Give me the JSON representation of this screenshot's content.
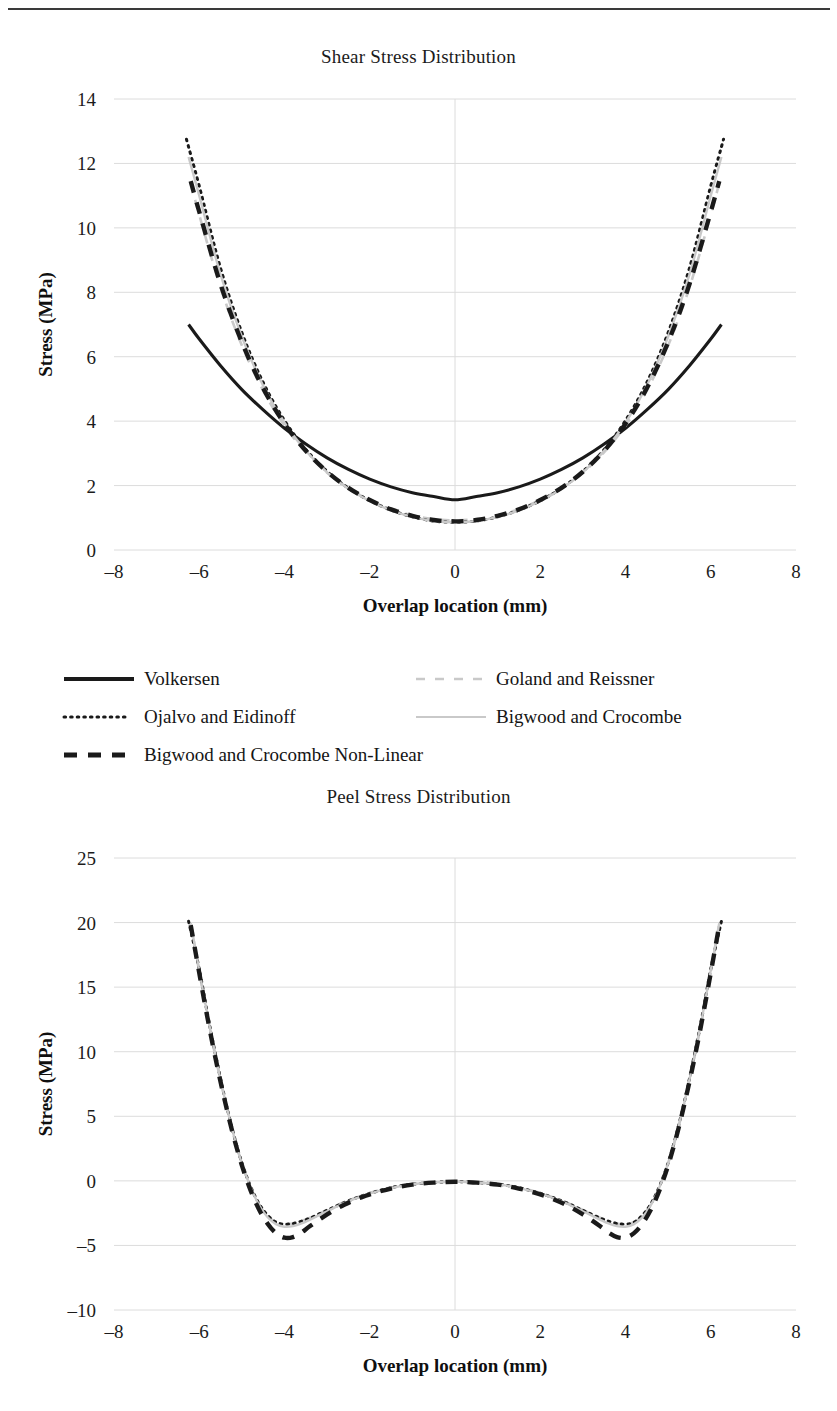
{
  "document": {
    "has_top_rule": true
  },
  "charts": [
    {
      "id": "shear",
      "title": "Shear Stress Distribution",
      "xlabel": "Overlap location (mm)",
      "ylabel": "Stress (MPa)"
    },
    {
      "id": "peel",
      "title": "Peel Stress Distribution",
      "xlabel": "Overlap location (mm)",
      "ylabel": "Stress (MPa)"
    }
  ],
  "legend": {
    "items": [
      {
        "label": "Volkersen",
        "style": "solid-thick-black",
        "color": "#1a1a1a"
      },
      {
        "label": "Goland and Reissner",
        "style": "dashed-thin-gray",
        "color": "#c9c9c9"
      },
      {
        "label": "Ojalvo and Eidinoff",
        "style": "dotted-black",
        "color": "#1a1a1a"
      },
      {
        "label": "Bigwood and Crocombe",
        "style": "solid-thin-gray",
        "color": "#c9c9c9"
      },
      {
        "label": "Bigwood and Crocombe Non-Linear",
        "style": "dashed-thick-black",
        "color": "#1a1a1a"
      }
    ]
  },
  "chart_data": [
    {
      "type": "line",
      "id": "shear",
      "title": "Shear Stress Distribution",
      "xlabel": "Overlap location (mm)",
      "ylabel": "Stress (MPa)",
      "xlim": [
        -8,
        8
      ],
      "ylim": [
        0,
        14
      ],
      "xticks": [
        -8,
        -6,
        -4,
        -2,
        0,
        2,
        4,
        6,
        8
      ],
      "xticklabels": [
        "–8",
        "–6",
        "–4",
        "–2",
        "0",
        "2",
        "4",
        "6",
        "8"
      ],
      "yticks": [
        0,
        2,
        4,
        6,
        8,
        10,
        12,
        14
      ],
      "yticklabels": [
        "0",
        "2",
        "4",
        "6",
        "8",
        "10",
        "12",
        "14"
      ],
      "grid": true,
      "legend_position": "below",
      "series": [
        {
          "name": "Volkersen",
          "style": "solid-thick-black",
          "color": "#1a1a1a",
          "x": [
            -6.25,
            -6.0,
            -5.5,
            -5.0,
            -4.5,
            -4.0,
            -3.5,
            -3.0,
            -2.5,
            -2.0,
            -1.5,
            -1.0,
            -0.5,
            0.0,
            0.5,
            1.0,
            1.5,
            2.0,
            2.5,
            3.0,
            3.5,
            4.0,
            4.5,
            5.0,
            5.5,
            6.0,
            6.25
          ],
          "y": [
            7.0,
            6.55,
            5.72,
            4.98,
            4.35,
            3.78,
            3.29,
            2.86,
            2.5,
            2.2,
            1.96,
            1.78,
            1.66,
            1.56,
            1.66,
            1.78,
            1.96,
            2.2,
            2.5,
            2.86,
            3.29,
            3.78,
            4.35,
            4.98,
            5.72,
            6.55,
            7.0
          ]
        },
        {
          "name": "Goland and Reissner",
          "style": "dashed-thin-gray",
          "color": "#c9c9c9",
          "x": [
            -6.2,
            -6.0,
            -5.5,
            -5.0,
            -4.5,
            -4.0,
            -3.5,
            -3.0,
            -2.5,
            -2.0,
            -1.5,
            -1.0,
            -0.5,
            0.0,
            0.5,
            1.0,
            1.5,
            2.0,
            2.5,
            3.0,
            3.5,
            4.0,
            4.5,
            5.0,
            5.5,
            6.0,
            6.2
          ],
          "y": [
            11.4,
            10.4,
            8.15,
            6.35,
            4.95,
            3.86,
            3.04,
            2.4,
            1.92,
            1.55,
            1.27,
            1.08,
            0.96,
            0.92,
            0.96,
            1.08,
            1.27,
            1.55,
            1.92,
            2.4,
            3.04,
            3.86,
            4.95,
            6.35,
            8.15,
            10.4,
            11.4
          ]
        },
        {
          "name": "Ojalvo and Eidinoff",
          "style": "dotted-black",
          "color": "#1a1a1a",
          "x": [
            -6.3,
            -6.0,
            -5.5,
            -5.0,
            -4.5,
            -4.0,
            -3.5,
            -3.0,
            -2.5,
            -2.0,
            -1.5,
            -1.0,
            -0.5,
            0.0,
            0.5,
            1.0,
            1.5,
            2.0,
            2.5,
            3.0,
            3.5,
            4.0,
            4.5,
            5.0,
            5.5,
            6.0,
            6.3
          ],
          "y": [
            12.75,
            11.3,
            8.75,
            6.75,
            5.2,
            4.02,
            3.12,
            2.44,
            1.92,
            1.53,
            1.24,
            1.03,
            0.9,
            0.86,
            0.9,
            1.03,
            1.24,
            1.53,
            1.92,
            2.44,
            3.12,
            4.02,
            5.2,
            6.75,
            8.75,
            11.3,
            12.75
          ]
        },
        {
          "name": "Bigwood and Crocombe",
          "style": "solid-thin-gray",
          "color": "#c9c9c9",
          "x": [
            -6.25,
            -6.0,
            -5.5,
            -5.0,
            -4.5,
            -4.0,
            -3.5,
            -3.0,
            -2.5,
            -2.0,
            -1.5,
            -1.0,
            -0.5,
            0.0,
            0.5,
            1.0,
            1.5,
            2.0,
            2.5,
            3.0,
            3.5,
            4.0,
            4.5,
            5.0,
            5.5,
            6.0,
            6.25
          ],
          "y": [
            12.2,
            11.0,
            8.55,
            6.62,
            5.1,
            3.95,
            3.08,
            2.41,
            1.9,
            1.52,
            1.23,
            1.03,
            0.9,
            0.86,
            0.9,
            1.03,
            1.23,
            1.52,
            1.9,
            2.41,
            3.08,
            3.95,
            5.1,
            6.62,
            8.55,
            11.0,
            12.2
          ]
        },
        {
          "name": "Bigwood and Crocombe Non-Linear",
          "style": "dashed-thick-black",
          "color": "#1a1a1a",
          "x": [
            -6.2,
            -6.0,
            -5.5,
            -5.0,
            -4.5,
            -4.0,
            -3.5,
            -3.0,
            -2.5,
            -2.0,
            -1.5,
            -1.0,
            -0.5,
            0.0,
            0.5,
            1.0,
            1.5,
            2.0,
            2.5,
            3.0,
            3.5,
            4.0,
            4.5,
            5.0,
            5.5,
            6.0,
            6.2
          ],
          "y": [
            11.45,
            10.5,
            8.25,
            6.45,
            5.02,
            3.92,
            3.08,
            2.43,
            1.93,
            1.55,
            1.26,
            1.06,
            0.93,
            0.89,
            0.93,
            1.06,
            1.26,
            1.55,
            1.93,
            2.43,
            3.08,
            3.92,
            5.02,
            6.45,
            8.25,
            10.5,
            11.45
          ]
        }
      ]
    },
    {
      "type": "line",
      "id": "peel",
      "title": "Peel Stress Distribution",
      "xlabel": "Overlap location (mm)",
      "ylabel": "Stress (MPa)",
      "xlim": [
        -8,
        8
      ],
      "ylim": [
        -10,
        25
      ],
      "xticks": [
        -8,
        -6,
        -4,
        -2,
        0,
        2,
        4,
        6,
        8
      ],
      "xticklabels": [
        "–8",
        "–6",
        "–4",
        "–2",
        "0",
        "2",
        "4",
        "6",
        "8"
      ],
      "yticks": [
        -10,
        -5,
        0,
        5,
        10,
        15,
        20,
        25
      ],
      "yticklabels": [
        "–10",
        "–5",
        "0",
        "5",
        "10",
        "15",
        "20",
        "25"
      ],
      "grid": true,
      "legend_position": "shared-above",
      "series": [
        {
          "name": "Goland and Reissner",
          "style": "dashed-thin-gray",
          "color": "#c9c9c9",
          "x": [
            -6.2,
            -6.0,
            -5.8,
            -5.6,
            -5.4,
            -5.2,
            -5.0,
            -4.8,
            -4.6,
            -4.4,
            -4.2,
            -4.0,
            -3.8,
            -3.6,
            -3.4,
            -3.0,
            -2.6,
            -2.2,
            -1.8,
            -1.4,
            -1.0,
            -0.5,
            0.0,
            0.5,
            1.0,
            1.4,
            1.8,
            2.2,
            2.6,
            3.0,
            3.4,
            3.6,
            3.8,
            4.0,
            4.2,
            4.4,
            4.6,
            4.8,
            5.0,
            5.2,
            5.4,
            5.6,
            5.8,
            6.0,
            6.2
          ],
          "y": [
            19.9,
            16.2,
            12.6,
            9.3,
            6.3,
            3.6,
            1.35,
            -0.45,
            -1.8,
            -2.7,
            -3.2,
            -3.35,
            -3.3,
            -3.1,
            -2.85,
            -2.25,
            -1.65,
            -1.15,
            -0.75,
            -0.45,
            -0.25,
            -0.12,
            -0.06,
            -0.12,
            -0.25,
            -0.45,
            -0.75,
            -1.15,
            -1.65,
            -2.25,
            -2.85,
            -3.1,
            -3.3,
            -3.35,
            -3.2,
            -2.7,
            -1.8,
            -0.45,
            1.35,
            3.6,
            6.3,
            9.3,
            12.6,
            16.2,
            19.9
          ]
        },
        {
          "name": "Ojalvo and Eidinoff",
          "style": "dotted-black",
          "color": "#1a1a1a",
          "x": [
            -6.25,
            -6.0,
            -5.8,
            -5.6,
            -5.4,
            -5.2,
            -5.0,
            -4.8,
            -4.6,
            -4.4,
            -4.2,
            -4.0,
            -3.8,
            -3.6,
            -3.4,
            -3.0,
            -2.6,
            -2.2,
            -1.8,
            -1.4,
            -1.0,
            -0.5,
            0.0,
            0.5,
            1.0,
            1.4,
            1.8,
            2.2,
            2.6,
            3.0,
            3.4,
            3.6,
            3.8,
            4.0,
            4.2,
            4.4,
            4.6,
            4.8,
            5.0,
            5.2,
            5.4,
            5.6,
            5.8,
            6.0,
            6.25
          ],
          "y": [
            20.1,
            16.4,
            12.8,
            9.5,
            6.4,
            3.7,
            1.4,
            -0.4,
            -1.75,
            -2.65,
            -3.2,
            -3.35,
            -3.3,
            -3.12,
            -2.88,
            -2.28,
            -1.68,
            -1.18,
            -0.78,
            -0.46,
            -0.26,
            -0.13,
            -0.06,
            -0.13,
            -0.26,
            -0.46,
            -0.78,
            -1.18,
            -1.68,
            -2.28,
            -2.88,
            -3.12,
            -3.3,
            -3.35,
            -3.2,
            -2.65,
            -1.75,
            -0.4,
            1.4,
            3.7,
            6.4,
            9.5,
            12.8,
            16.4,
            20.1
          ]
        },
        {
          "name": "Bigwood and Crocombe",
          "style": "solid-thin-gray",
          "color": "#c9c9c9",
          "x": [
            -6.2,
            -6.0,
            -5.8,
            -5.6,
            -5.4,
            -5.2,
            -5.0,
            -4.8,
            -4.6,
            -4.4,
            -4.2,
            -4.0,
            -3.8,
            -3.6,
            -3.4,
            -3.0,
            -2.6,
            -2.2,
            -1.8,
            -1.4,
            -1.0,
            -0.5,
            0.0,
            0.5,
            1.0,
            1.4,
            1.8,
            2.2,
            2.6,
            3.0,
            3.4,
            3.6,
            3.8,
            4.0,
            4.2,
            4.4,
            4.6,
            4.8,
            5.0,
            5.2,
            5.4,
            5.6,
            5.8,
            6.0,
            6.2
          ],
          "y": [
            19.95,
            16.3,
            12.7,
            9.4,
            6.35,
            3.65,
            1.35,
            -0.45,
            -1.85,
            -2.8,
            -3.35,
            -3.55,
            -3.5,
            -3.3,
            -3.0,
            -2.35,
            -1.72,
            -1.2,
            -0.8,
            -0.48,
            -0.27,
            -0.13,
            -0.06,
            -0.13,
            -0.27,
            -0.48,
            -0.8,
            -1.2,
            -1.72,
            -2.35,
            -3.0,
            -3.3,
            -3.5,
            -3.55,
            -3.35,
            -2.8,
            -1.85,
            -0.45,
            1.35,
            3.65,
            6.35,
            9.4,
            12.7,
            16.3,
            19.95
          ]
        },
        {
          "name": "Bigwood and Crocombe Non-Linear",
          "style": "dashed-thick-black",
          "color": "#1a1a1a",
          "x": [
            -6.2,
            -6.0,
            -5.8,
            -5.6,
            -5.4,
            -5.2,
            -5.0,
            -4.8,
            -4.6,
            -4.4,
            -4.2,
            -4.0,
            -3.8,
            -3.6,
            -3.4,
            -3.0,
            -2.6,
            -2.2,
            -1.8,
            -1.4,
            -1.0,
            -0.5,
            0.0,
            0.5,
            1.0,
            1.4,
            1.8,
            2.2,
            2.6,
            3.0,
            3.4,
            3.6,
            3.8,
            4.0,
            4.2,
            4.4,
            4.6,
            4.8,
            5.0,
            5.2,
            5.4,
            5.6,
            5.8,
            6.0,
            6.2
          ],
          "y": [
            19.8,
            16.1,
            12.5,
            9.2,
            6.2,
            3.5,
            1.2,
            -0.7,
            -2.2,
            -3.3,
            -4.05,
            -4.4,
            -4.35,
            -4.0,
            -3.5,
            -2.6,
            -1.85,
            -1.28,
            -0.85,
            -0.52,
            -0.29,
            -0.14,
            -0.07,
            -0.14,
            -0.29,
            -0.52,
            -0.85,
            -1.28,
            -1.85,
            -2.6,
            -3.5,
            -4.0,
            -4.35,
            -4.4,
            -4.05,
            -3.3,
            -2.2,
            -0.7,
            1.2,
            3.5,
            6.2,
            9.2,
            12.5,
            16.1,
            19.8
          ]
        }
      ]
    }
  ]
}
